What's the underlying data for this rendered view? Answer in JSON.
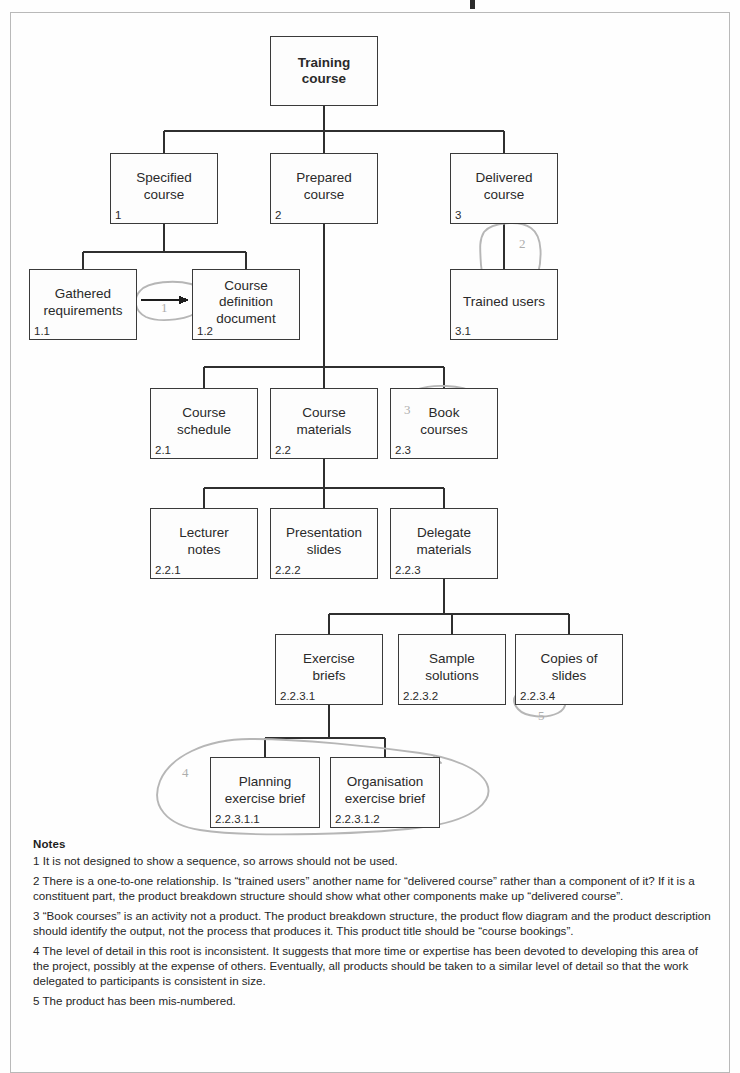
{
  "diagram": {
    "type": "product-breakdown-structure",
    "title_partial": "",
    "nodes": [
      {
        "key": "training_course",
        "label": "Training\ncourse",
        "id": "",
        "bold": true,
        "x": 270,
        "y": 36,
        "w": 108,
        "h": 70
      },
      {
        "key": "specified_course",
        "label": "Specified\ncourse",
        "id": "1",
        "bold": false,
        "x": 110,
        "y": 153,
        "w": 108,
        "h": 71
      },
      {
        "key": "prepared_course",
        "label": "Prepared\ncourse",
        "id": "2",
        "bold": false,
        "x": 270,
        "y": 153,
        "w": 108,
        "h": 71
      },
      {
        "key": "delivered_course",
        "label": "Delivered\ncourse",
        "id": "3",
        "bold": false,
        "x": 450,
        "y": 153,
        "w": 108,
        "h": 71
      },
      {
        "key": "gathered_requirements",
        "label": "Gathered\nrequirements",
        "id": "1.1",
        "bold": false,
        "x": 29,
        "y": 269,
        "w": 108,
        "h": 71
      },
      {
        "key": "course_definition_doc",
        "label": "Course\ndefinition\ndocument",
        "id": "1.2",
        "bold": false,
        "x": 192,
        "y": 269,
        "w": 108,
        "h": 71
      },
      {
        "key": "trained_users",
        "label": "Trained users",
        "id": "3.1",
        "bold": false,
        "x": 450,
        "y": 269,
        "w": 108,
        "h": 71
      },
      {
        "key": "course_schedule",
        "label": "Course\nschedule",
        "id": "2.1",
        "bold": false,
        "x": 150,
        "y": 388,
        "w": 108,
        "h": 71
      },
      {
        "key": "course_materials",
        "label": "Course\nmaterials",
        "id": "2.2",
        "bold": false,
        "x": 270,
        "y": 388,
        "w": 108,
        "h": 71
      },
      {
        "key": "book_courses",
        "label": "Book\ncourses",
        "id": "2.3",
        "bold": false,
        "x": 390,
        "y": 388,
        "w": 108,
        "h": 71
      },
      {
        "key": "lecturer_notes",
        "label": "Lecturer\nnotes",
        "id": "2.2.1",
        "bold": false,
        "x": 150,
        "y": 508,
        "w": 108,
        "h": 71
      },
      {
        "key": "presentation_slides",
        "label": "Presentation\nslides",
        "id": "2.2.2",
        "bold": false,
        "x": 270,
        "y": 508,
        "w": 108,
        "h": 71
      },
      {
        "key": "delegate_materials",
        "label": "Delegate\nmaterials",
        "id": "2.2.3",
        "bold": false,
        "x": 390,
        "y": 508,
        "w": 108,
        "h": 71
      },
      {
        "key": "exercise_briefs",
        "label": "Exercise\nbriefs",
        "id": "2.2.3.1",
        "bold": false,
        "x": 275,
        "y": 634,
        "w": 108,
        "h": 71
      },
      {
        "key": "sample_solutions",
        "label": "Sample\nsolutions",
        "id": "2.2.3.2",
        "bold": false,
        "x": 398,
        "y": 634,
        "w": 108,
        "h": 71
      },
      {
        "key": "copies_of_slides",
        "label": "Copies of\nslides",
        "id": "2.2.3.4",
        "bold": false,
        "x": 515,
        "y": 634,
        "w": 108,
        "h": 71
      },
      {
        "key": "planning_exercise",
        "label": "Planning\nexercise brief",
        "id": "2.2.3.1.1",
        "bold": false,
        "x": 210,
        "y": 757,
        "w": 110,
        "h": 71
      },
      {
        "key": "organisation_exercise",
        "label": "Organisation\nexercise brief",
        "id": "2.2.3.1.2",
        "bold": false,
        "x": 330,
        "y": 757,
        "w": 110,
        "h": 71
      }
    ],
    "annotation_numbers": [
      {
        "key": "anno-1",
        "text": "1",
        "x": 161,
        "y": 300
      },
      {
        "key": "anno-2",
        "text": "2",
        "x": 519,
        "y": 236
      },
      {
        "key": "anno-3",
        "text": "3",
        "x": 404,
        "y": 402
      },
      {
        "key": "anno-4",
        "text": "4",
        "x": 182,
        "y": 765
      },
      {
        "key": "anno-5",
        "text": "5",
        "x": 538,
        "y": 708
      }
    ]
  },
  "notes": {
    "title": "Notes",
    "items": [
      "1 It is not designed to show a sequence, so arrows should not be used.",
      "2 There is a one-to-one relationship. Is “trained users” another name for “delivered course” rather than a component of it? If it is a constituent part, the product breakdown structure should show what other components make up “delivered course”.",
      "3 “Book courses” is an activity not a product. The product breakdown structure, the product flow diagram and the product description should identify the output, not the process that produces it. This product title should be “course bookings”.",
      "4 The level of detail in this root is inconsistent. It suggests that more time or expertise has been devoted to developing this area of the project, possibly at the expense of others. Eventually, all products should be taken to a similar level of detail so that the work delegated to participants is consistent in size.",
      "5 The product has been mis-numbered."
    ]
  },
  "colors": {
    "frame_border": "#b9b9b9",
    "node_border": "#3a3a3a",
    "text": "#262626",
    "annotation_ink": "#adadad",
    "connector": "#2f2f2f"
  }
}
